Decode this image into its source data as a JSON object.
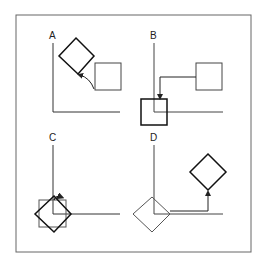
{
  "figure": {
    "panels": [
      {
        "id": "A",
        "label": "A",
        "description": "Rotated square with curved rotation arrow from upright square"
      },
      {
        "id": "B",
        "label": "B",
        "description": "Square translated to origin with elbow arrow"
      },
      {
        "id": "C",
        "label": "C",
        "description": "Square and rotated square overlapping at origin with rotation arrow"
      },
      {
        "id": "D",
        "label": "D",
        "description": "Rotated square at origin translated with elbow arrow to new position"
      }
    ],
    "colors": {
      "stroke": "#222222",
      "light_stroke": "#555555",
      "border": "#555555",
      "background": "#ffffff"
    }
  }
}
